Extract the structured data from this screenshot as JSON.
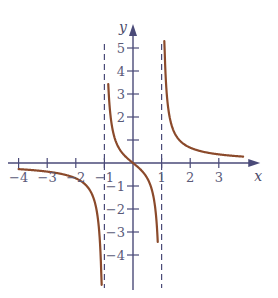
{
  "chart_data": {
    "type": "line",
    "title": "",
    "xlabel": "x",
    "ylabel": "y",
    "xlim": [
      -4.3,
      4.3
    ],
    "ylim": [
      -5.2,
      5.6
    ],
    "grid": false,
    "legend": null,
    "x_ticks": [
      -4,
      -3,
      -2,
      -1,
      1,
      2,
      3
    ],
    "x_tick_labels": [
      "−4",
      "−3",
      "−2",
      "−1",
      "1",
      "2",
      "3"
    ],
    "y_ticks": [
      5,
      4,
      3,
      2,
      1,
      -1,
      -2,
      -3,
      -4
    ],
    "y_tick_labels": [
      "5",
      "4",
      "3",
      "2",
      "",
      "−1",
      "−2",
      "−3",
      "−4"
    ],
    "vertical_asymptotes": [
      -1,
      1
    ],
    "horizontal_asymptote": 0,
    "function": "y = x / (x^2 - 1)",
    "series": [
      {
        "name": "left-branch",
        "x": [
          -4,
          -3.5,
          -3,
          -2.5,
          -2,
          -1.6,
          -1.3,
          -1.15,
          -1.1
        ],
        "values": [
          -0.27,
          -0.31,
          -0.375,
          -0.48,
          -0.67,
          -1.03,
          -1.88,
          -3.57,
          -5.24
        ]
      },
      {
        "name": "middle-branch",
        "x": [
          -0.85,
          -0.7,
          -0.5,
          -0.3,
          0,
          0.3,
          0.5,
          0.7,
          0.85
        ],
        "values": [
          3.06,
          1.37,
          0.67,
          0.33,
          0,
          -0.33,
          -0.67,
          -1.37,
          -3.06
        ]
      },
      {
        "name": "right-branch",
        "x": [
          1.1,
          1.15,
          1.3,
          1.6,
          2,
          2.5,
          3,
          3.5,
          3.8
        ],
        "values": [
          5.24,
          3.57,
          1.88,
          1.03,
          0.67,
          0.48,
          0.375,
          0.31,
          0.28
        ]
      }
    ],
    "colors": {
      "curve": "#8b4a2b",
      "axis": "#4a4a78",
      "asymptote": "#4a4a78"
    }
  }
}
